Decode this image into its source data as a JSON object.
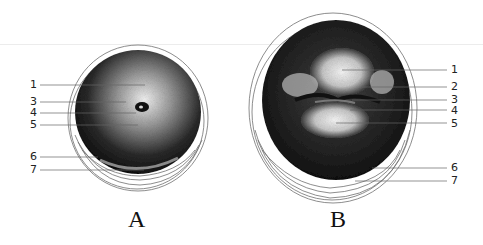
{
  "figure": {
    "panels": [
      {
        "id": "A",
        "caption": "A",
        "labels": [
          {
            "num": "1",
            "side": "left"
          },
          {
            "num": "3",
            "side": "left"
          },
          {
            "num": "4",
            "side": "left"
          },
          {
            "num": "5",
            "side": "left"
          },
          {
            "num": "6",
            "side": "left"
          },
          {
            "num": "7",
            "side": "left"
          }
        ]
      },
      {
        "id": "B",
        "caption": "B",
        "labels": [
          {
            "num": "1",
            "side": "right"
          },
          {
            "num": "2",
            "side": "right"
          },
          {
            "num": "3",
            "side": "right"
          },
          {
            "num": "4",
            "side": "right"
          },
          {
            "num": "5",
            "side": "right"
          },
          {
            "num": "6",
            "side": "right"
          },
          {
            "num": "7",
            "side": "right"
          }
        ]
      }
    ],
    "colors": {
      "ink": "#1a1a1a",
      "background": "#ffffff",
      "leader": "#555555"
    }
  }
}
